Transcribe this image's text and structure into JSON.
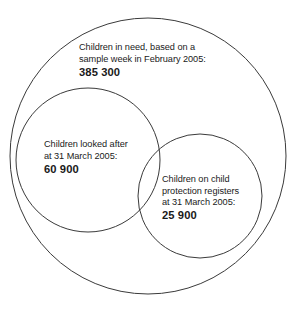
{
  "diagram": {
    "type": "venn",
    "background_color": "#ffffff",
    "stroke_color": "#3a3a3a",
    "text_color": "#1a1a1a",
    "sets": [
      {
        "id": "children-in-need",
        "name": "Children in need",
        "lines": [
          "Children in need, based on a",
          "sample week in February 2005:"
        ],
        "value": "385 300",
        "value_number": 385300,
        "circle": {
          "cx": 148,
          "cy": 156,
          "r": 138
        }
      },
      {
        "id": "children-looked-after",
        "name": "Children looked after",
        "lines": [
          "Children looked after",
          "at 31 March 2005:"
        ],
        "value": "60 900",
        "value_number": 60900,
        "circle": {
          "cx": 88,
          "cy": 160,
          "r": 72
        }
      },
      {
        "id": "child-protection-registers",
        "name": "Children on child protection registers",
        "lines": [
          "Children on child",
          "protection registers",
          "at 31 March 2005:"
        ],
        "value": "25 900",
        "value_number": 25900,
        "circle": {
          "cx": 200,
          "cy": 196,
          "r": 62
        }
      }
    ]
  }
}
